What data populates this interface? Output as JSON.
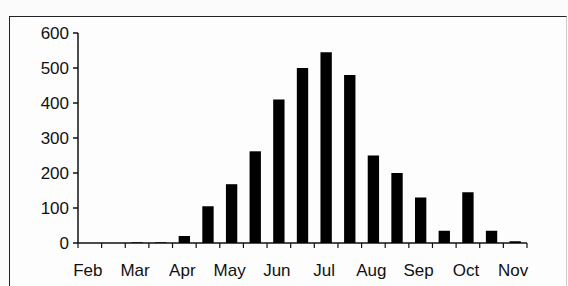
{
  "chart_data": {
    "type": "bar",
    "title": "",
    "xlabel": "",
    "ylabel": "",
    "ylim": [
      0,
      600
    ],
    "yticks": [
      0,
      100,
      200,
      300,
      400,
      500,
      600
    ],
    "xtick_labels": [
      "Feb",
      "Mar",
      "Apr",
      "May",
      "Jun",
      "Jul",
      "Aug",
      "Sep",
      "Oct",
      "Nov"
    ],
    "categories": [
      "Feb",
      "Feb (2)",
      "Mar",
      "Mar (2)",
      "Apr",
      "Apr (2)",
      "May",
      "May (2)",
      "Jun",
      "Jun (2)",
      "Jul",
      "Jul (2)",
      "Aug",
      "Aug (2)",
      "Sep",
      "Sep (2)",
      "Oct",
      "Oct (2)",
      "Nov"
    ],
    "values": [
      0,
      0,
      2,
      2,
      20,
      105,
      168,
      262,
      410,
      500,
      545,
      480,
      250,
      200,
      130,
      35,
      145,
      35,
      5
    ],
    "bar_color": "#000000",
    "grid": false,
    "legend": null
  }
}
